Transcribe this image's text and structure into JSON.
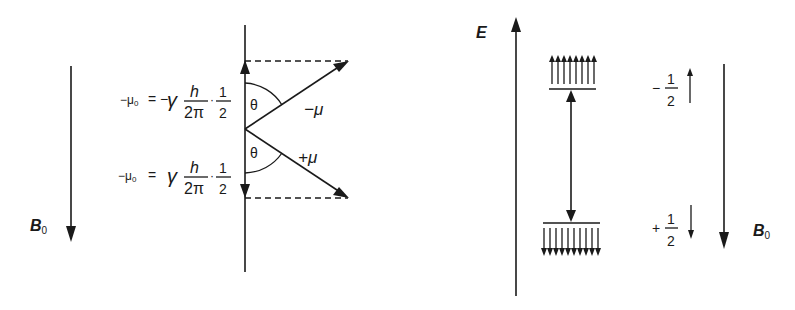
{
  "left_panel": {
    "field_label": "B",
    "field_subscript": "0",
    "equation_upper": {
      "lhs": "−μ",
      "lhs_sub": "0",
      "eq": "=",
      "sign": "−",
      "gamma": "γ",
      "h": "h",
      "two_pi": "2π",
      "dot": "·",
      "num": "1",
      "den": "2"
    },
    "equation_lower": {
      "lhs": "−μ",
      "lhs_sub": "0",
      "eq": "=",
      "gamma": "γ",
      "h": "h",
      "two_pi": "2π",
      "dot": "·",
      "num": "1",
      "den": "2"
    },
    "angle_upper": "θ",
    "angle_lower": "θ",
    "vector_upper_label": "−μ",
    "vector_lower_label": "+μ"
  },
  "right_panel": {
    "energy_axis_label": "E",
    "upper_level": {
      "spin_sign": "−",
      "spin_num": "1",
      "spin_den": "2",
      "arrow_count": 8,
      "direction": "up"
    },
    "lower_level": {
      "spin_sign": "+",
      "spin_num": "1",
      "spin_den": "2",
      "arrow_count": 10,
      "direction": "down"
    },
    "field_label": "B",
    "field_subscript": "0"
  },
  "colors": {
    "ink": "#1a1a1a",
    "background": "#ffffff"
  }
}
